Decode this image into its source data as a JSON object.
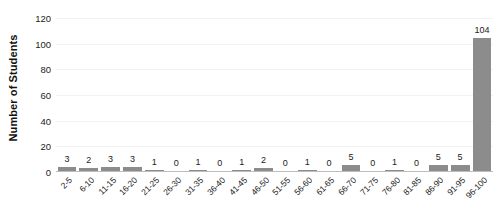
{
  "chart_data": {
    "type": "bar",
    "title": "",
    "xlabel": "",
    "ylabel": "Number of Students",
    "ylim": [
      0,
      120
    ],
    "ytick_step": 20,
    "yticks": [
      0,
      20,
      40,
      60,
      80,
      100,
      120
    ],
    "grid": true,
    "legend": "none",
    "bar_color": "#8c8c8c",
    "gridline_color": "#f2f2f2",
    "axis_color": "#bdbdbd",
    "show_data_labels": true,
    "categories": [
      "2-5",
      "6-10",
      "11-15",
      "16-20",
      "21-25",
      "26-30",
      "31-35",
      "36-40",
      "41-45",
      "46-50",
      "51-55",
      "56-60",
      "61-65",
      "66-70",
      "71-75",
      "76-80",
      "81-85",
      "86-90",
      "91-95",
      "96-100"
    ],
    "values": [
      3,
      2,
      3,
      3,
      1,
      0,
      1,
      0,
      1,
      2,
      0,
      1,
      0,
      5,
      0,
      1,
      0,
      5,
      5,
      104
    ]
  }
}
